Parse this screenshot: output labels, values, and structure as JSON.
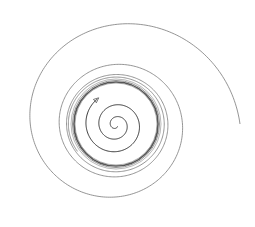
{
  "diagram": {
    "type": "phase-portrait",
    "center": [
      116,
      125
    ],
    "limit_cycle_radius": 44,
    "colors": {
      "background": "#ffffff",
      "inner_spiral": "#333333",
      "limit_cycle": "#555555",
      "outer_spiral": "#777777"
    },
    "elements": {
      "inner_spiral": {
        "direction": "outward",
        "arrow": "arrowhead at end near (146,123)"
      },
      "outer_spiral": {
        "direction": "inward",
        "start_point": [
          240,
          125
        ]
      },
      "limit_cycle": {
        "shape": "circle"
      }
    }
  }
}
